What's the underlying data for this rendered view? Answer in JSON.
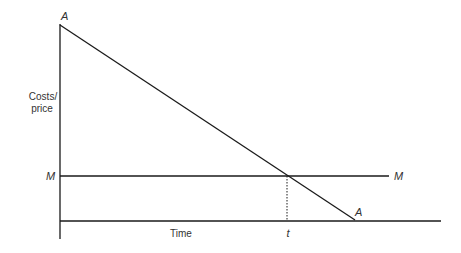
{
  "diagram": {
    "y_axis_label_line1": "Costs/",
    "y_axis_label_line2": "price",
    "x_axis_label": "Time",
    "curve_a_label_top": "A",
    "curve_a_label_end": "A",
    "line_m_label_left": "M",
    "line_m_label_right": "M",
    "intersection_label": "t",
    "colors": {
      "line": "#1a1a1a",
      "text": "#333333"
    }
  }
}
